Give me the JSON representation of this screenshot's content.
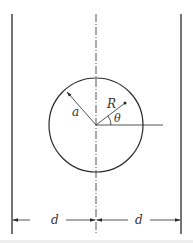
{
  "diagram": {
    "labels": {
      "radius": "a",
      "position": "R",
      "angle": "θ",
      "left_distance": "d",
      "right_distance": "d"
    },
    "colors": {
      "stroke": "#2a2a2a",
      "background": "#ffffff"
    }
  }
}
